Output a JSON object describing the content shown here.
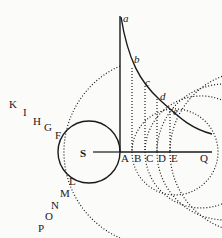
{
  "figure": {
    "center": {
      "x": 89,
      "y": 152
    },
    "central_circle": {
      "radius": 31
    },
    "dotted_circles": [
      {
        "radius": 43,
        "left_label": "F",
        "lower_label": "L",
        "axis_label": "B",
        "curve_label": "b"
      },
      {
        "radius": 56,
        "left_label": "G",
        "lower_label": "M",
        "axis_label": "C",
        "curve_label": "c"
      },
      {
        "radius": 68,
        "left_label": "H",
        "lower_label": "N",
        "axis_label": "D",
        "curve_label": "d"
      },
      {
        "radius": 81,
        "left_label": "I",
        "lower_label": "O",
        "axis_label": "E",
        "curve_label": "e"
      },
      {
        "radius": 94,
        "left_label": "K",
        "lower_label": "P"
      }
    ],
    "labels": {
      "S": "S",
      "A": "A",
      "B": "B",
      "C": "C",
      "D": "D",
      "E": "E",
      "Q": "Q",
      "a": "a",
      "b": "b",
      "c": "c",
      "d": "d",
      "e": "e",
      "F": "F",
      "G": "G",
      "H": "H",
      "I": "I",
      "K": "K",
      "L": "L",
      "M": "M",
      "N": "N",
      "O": "O",
      "P": "P"
    },
    "stroke_color": "#1a1a1a",
    "background_color": "#fbfbf9"
  }
}
